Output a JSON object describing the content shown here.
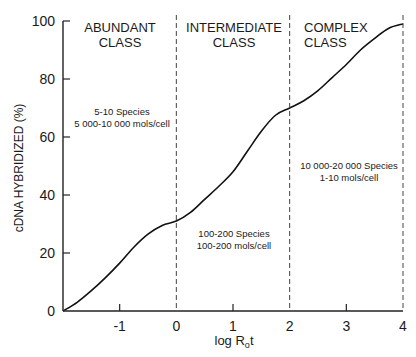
{
  "chart_data": {
    "type": "line",
    "title": "",
    "xlabel": "log R",
    "xlabel_sub": "o",
    "xlabel_suffix": "t",
    "ylabel": "cDNA HYBRIDIZED (%)",
    "xlim": [
      -2,
      4
    ],
    "ylim": [
      0,
      100
    ],
    "x_ticks": [
      -1,
      0,
      1,
      2,
      3,
      4
    ],
    "x_tick_labels": [
      "-1",
      "0",
      "1",
      "2",
      "3",
      "4"
    ],
    "y_ticks": [
      0,
      20,
      40,
      60,
      80,
      100
    ],
    "y_tick_labels": [
      "0",
      "20",
      "40",
      "60",
      "80",
      "100"
    ],
    "grid": false,
    "series": [
      {
        "name": "cDNA hybridization",
        "x": [
          -2,
          -1.75,
          -1.5,
          -1.25,
          -1,
          -0.75,
          -0.5,
          -0.25,
          0,
          0.25,
          0.5,
          0.75,
          1,
          1.25,
          1.5,
          1.75,
          2,
          2.25,
          2.5,
          2.75,
          3,
          3.25,
          3.5,
          3.75,
          4
        ],
        "values": [
          0,
          3,
          7,
          11.5,
          16.5,
          22,
          26.5,
          29.5,
          31,
          34,
          38.5,
          43,
          48,
          55,
          62,
          67.5,
          70,
          72.5,
          76,
          80.5,
          85,
          90,
          94,
          97.5,
          99
        ]
      }
    ],
    "dividers": [
      0,
      2,
      4
    ],
    "regions": [
      {
        "title_line1": "ABUNDANT",
        "title_line2": "CLASS",
        "line1": "5-10 Species",
        "line2": "5 000-10 000 mols/cell"
      },
      {
        "title_line1": "INTERMEDIATE",
        "title_line2": "CLASS",
        "line1": "100-200 Species",
        "line2": "100-200 mols/cell"
      },
      {
        "title_line1": "COMPLEX",
        "title_line2": "CLASS",
        "line1": "10 000-20 000 Species",
        "line2": "1-10 mols/cell"
      }
    ]
  }
}
